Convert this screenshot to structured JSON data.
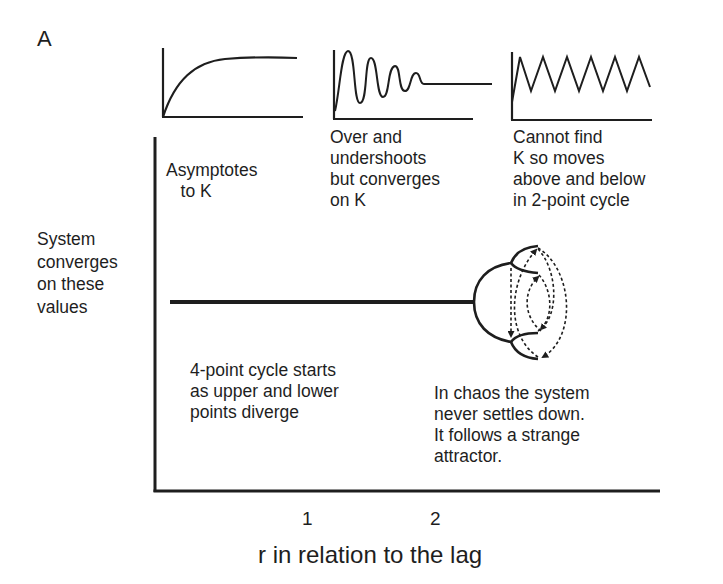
{
  "figure": {
    "panel_label": "A",
    "y_axis_label": "System\nconverges\non these\nvalues",
    "x_axis_label": "r in relation to the lag",
    "x_ticks": [
      "1",
      "2"
    ],
    "insets": [
      {
        "name": "asymptotic",
        "caption": "Asymptotes\n   to K"
      },
      {
        "name": "damped-oscillation",
        "caption": "Over and\nundershoots\nbut converges\non K"
      },
      {
        "name": "two-point-cycle",
        "caption": "Cannot find\nK so moves\nabove and below\nin 2-point cycle"
      }
    ],
    "annotations": {
      "four_point": "4-point cycle starts\nas upper and lower\npoints diverge",
      "chaos": "In chaos the system\nnever settles down.\nIt follows a strange\nattractor."
    },
    "colors": {
      "ink": "#1e1e1e",
      "background": "#ffffff"
    }
  }
}
